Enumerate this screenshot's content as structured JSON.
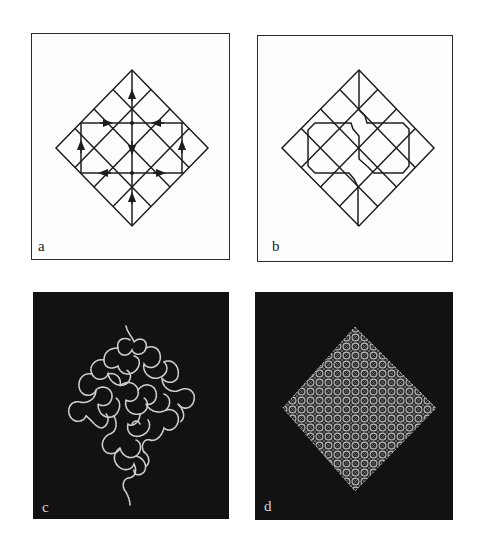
{
  "figure": {
    "panels": [
      {
        "id": "a",
        "label": "a",
        "description": "Diamond grid with arrows indicating directed edges"
      },
      {
        "id": "b",
        "label": "b",
        "description": "Diamond grid with a traced closed path"
      },
      {
        "id": "c",
        "label": "c",
        "description": "Meandering curved path inside a diamond on dark background"
      },
      {
        "id": "d",
        "label": "d",
        "description": "Dense woven diamond pattern on dark background"
      }
    ]
  },
  "colors": {
    "line": "#1e1e1e",
    "dark_bg": "#121212",
    "light_trace": "#cfcfcf"
  }
}
